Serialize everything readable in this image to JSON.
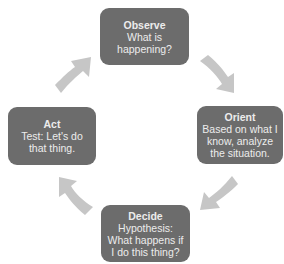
{
  "diagram": {
    "type": "cycle",
    "name": "OODA loop",
    "colors": {
      "box_fill": "#6c6c6c",
      "box_text": "#ececec",
      "arrow_fill": "#c6c6c6",
      "background": "#ffffff"
    },
    "nodes": [
      {
        "id": "observe",
        "title": "Observe",
        "text": "What is happening?"
      },
      {
        "id": "orient",
        "title": "Orient",
        "text": "Based on what I know, analyze the situation."
      },
      {
        "id": "decide",
        "title": "Decide",
        "text": "Hypothesis: What happens if I do this thing?"
      },
      {
        "id": "act",
        "title": "Act",
        "text": "Test: Let's do that thing."
      }
    ],
    "edges": [
      {
        "from": "observe",
        "to": "orient",
        "direction": "down-right"
      },
      {
        "from": "orient",
        "to": "decide",
        "direction": "down-left"
      },
      {
        "from": "decide",
        "to": "act",
        "direction": "up-left"
      },
      {
        "from": "act",
        "to": "observe",
        "direction": "up-right"
      }
    ]
  }
}
